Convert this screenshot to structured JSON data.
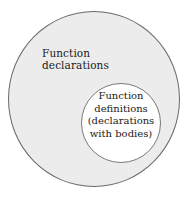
{
  "diagram": {
    "type": "nested-set (Euler diagram)",
    "outer_set": {
      "label_lines": [
        "Function",
        "declarations"
      ],
      "fill_color": "#ececec",
      "stroke_color": "#6a6a6a"
    },
    "inner_set": {
      "label_lines": [
        "Function",
        "definitions",
        "(declarations",
        "with bodies)"
      ],
      "fill_color": "#ffffff",
      "stroke_color": "#7a7a7a"
    },
    "relationship": "Function definitions are a subset of function declarations"
  }
}
